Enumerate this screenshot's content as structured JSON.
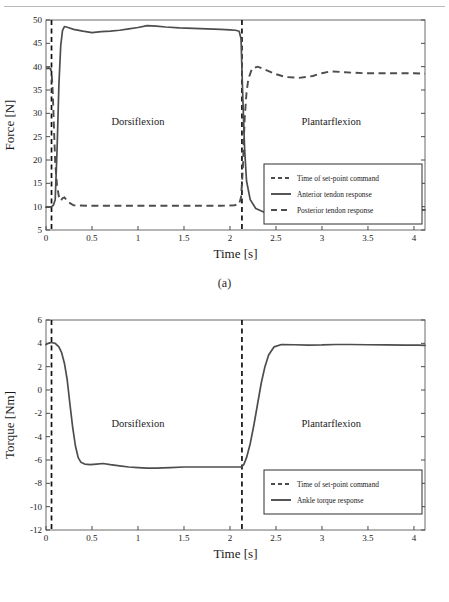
{
  "figure": {
    "caption_a": "(a)",
    "caption_b": "(b)"
  },
  "chart_data": [
    {
      "id": "force-plot",
      "type": "line",
      "title": "",
      "subplot_label": "(a)",
      "xlabel": "Time [s]",
      "ylabel": "Force [N]",
      "xlim": [
        0,
        4.12
      ],
      "ylim": [
        5,
        50
      ],
      "xticks": [
        0,
        0.5,
        1,
        1.5,
        2,
        2.5,
        3,
        3.5,
        4
      ],
      "xticklabels": [
        "0",
        "0.5",
        "1",
        "1.5",
        "2",
        "2.5",
        "3",
        "3.5",
        "4"
      ],
      "yticks": [
        5,
        10,
        15,
        20,
        25,
        30,
        35,
        40,
        45,
        50
      ],
      "yticklabels": [
        "5",
        "10",
        "15",
        "20",
        "25",
        "30",
        "35",
        "40",
        "45",
        "50"
      ],
      "grid": false,
      "annotations": [
        {
          "text": "Dorsiflexion",
          "x": 1.0,
          "y": 27.5
        },
        {
          "text": "Plantarflexion",
          "x": 3.1,
          "y": 27.5
        }
      ],
      "vlines": [
        0.06,
        2.13
      ],
      "legend_position": "center-right",
      "legend": [
        {
          "label": "Time of set-point command",
          "style": "dashed-thin"
        },
        {
          "label": "Anterior tendon response",
          "style": "solid"
        },
        {
          "label": "Posterior tendon response",
          "style": "dashed-thick"
        }
      ],
      "series": [
        {
          "name": "Anterior tendon response",
          "style": "solid",
          "x": [
            0.0,
            0.04,
            0.06,
            0.08,
            0.1,
            0.12,
            0.14,
            0.16,
            0.18,
            0.2,
            0.24,
            0.3,
            0.4,
            0.5,
            0.6,
            0.7,
            0.8,
            0.9,
            1.0,
            1.1,
            1.2,
            1.3,
            1.45,
            1.6,
            1.75,
            1.9,
            2.0,
            2.06,
            2.1,
            2.12,
            2.14,
            2.16,
            2.18,
            2.22,
            2.28,
            2.36,
            2.5,
            2.7,
            2.9,
            3.1,
            3.3,
            3.55,
            3.8,
            4.0,
            4.12
          ],
          "y": [
            9.9,
            9.9,
            10.0,
            10.3,
            11.5,
            22.0,
            36.0,
            44.5,
            47.8,
            48.6,
            48.4,
            48.0,
            47.6,
            47.3,
            47.5,
            47.6,
            47.8,
            48.1,
            48.4,
            48.8,
            48.7,
            48.5,
            48.3,
            48.2,
            48.1,
            48.0,
            47.9,
            47.8,
            47.6,
            46.0,
            33.0,
            22.0,
            15.5,
            11.5,
            9.6,
            8.9,
            8.8,
            8.8,
            8.9,
            8.9,
            8.9,
            9.0,
            9.1,
            9.2,
            9.3
          ]
        },
        {
          "name": "Posterior tendon response",
          "style": "dashed-thick",
          "x": [
            0.0,
            0.03,
            0.05,
            0.06,
            0.07,
            0.08,
            0.09,
            0.1,
            0.12,
            0.14,
            0.16,
            0.18,
            0.2,
            0.24,
            0.3,
            0.45,
            0.7,
            1.0,
            1.3,
            1.6,
            1.9,
            2.05,
            2.1,
            2.12,
            2.14,
            2.15,
            2.16,
            2.18,
            2.2,
            2.24,
            2.3,
            2.4,
            2.5,
            2.6,
            2.75,
            2.9,
            3.0,
            3.1,
            3.25,
            3.45,
            3.65,
            3.85,
            4.0,
            4.12
          ],
          "y": [
            39.6,
            39.7,
            39.5,
            38.8,
            36.0,
            31.0,
            25.0,
            19.5,
            14.5,
            12.2,
            11.3,
            11.8,
            12.0,
            11.0,
            10.3,
            10.2,
            10.2,
            10.2,
            10.2,
            10.2,
            10.2,
            10.3,
            10.6,
            12.0,
            18.0,
            24.0,
            29.0,
            34.5,
            37.4,
            39.6,
            40.0,
            39.2,
            38.4,
            37.8,
            37.6,
            38.0,
            38.6,
            39.0,
            38.8,
            38.6,
            38.6,
            38.6,
            38.6,
            38.5
          ]
        }
      ]
    },
    {
      "id": "torque-plot",
      "type": "line",
      "title": "",
      "subplot_label": "(b)",
      "xlabel": "Time [s]",
      "ylabel": "Torque [Nm]",
      "xlim": [
        0,
        4.12
      ],
      "ylim": [
        -12,
        6
      ],
      "xticks": [
        0,
        0.5,
        1,
        1.5,
        2,
        2.5,
        3,
        3.5,
        4
      ],
      "xticklabels": [
        "0",
        "0.5",
        "1",
        "1.5",
        "2",
        "2.5",
        "3",
        "3.5",
        "4"
      ],
      "yticks": [
        -12,
        -10,
        -8,
        -6,
        -4,
        -2,
        0,
        2,
        4,
        6
      ],
      "yticklabels": [
        "-12",
        "-10",
        "-8",
        "-6",
        "-4",
        "-2",
        "0",
        "2",
        "4",
        "6"
      ],
      "grid": false,
      "annotations": [
        {
          "text": "Dorsiflexion",
          "x": 1.0,
          "y": -3.2
        },
        {
          "text": "Plantarflexion",
          "x": 3.1,
          "y": -3.2
        }
      ],
      "vlines": [
        0.06,
        2.13
      ],
      "legend_position": "lower-right",
      "legend": [
        {
          "label": "Time of set-point command",
          "style": "dashed-thin"
        },
        {
          "label": "Ankle torque response",
          "style": "solid"
        }
      ],
      "series": [
        {
          "name": "Ankle torque response",
          "style": "solid",
          "x": [
            0.0,
            0.04,
            0.07,
            0.1,
            0.14,
            0.17,
            0.2,
            0.23,
            0.26,
            0.29,
            0.32,
            0.35,
            0.38,
            0.42,
            0.48,
            0.55,
            0.62,
            0.7,
            0.8,
            0.9,
            1.0,
            1.1,
            1.2,
            1.35,
            1.5,
            1.7,
            1.9,
            2.05,
            2.12,
            2.15,
            2.18,
            2.22,
            2.26,
            2.3,
            2.34,
            2.38,
            2.42,
            2.48,
            2.56,
            2.7,
            2.85,
            3.0,
            3.15,
            3.3,
            3.5,
            3.7,
            3.9,
            4.05,
            4.12
          ],
          "y": [
            3.9,
            4.05,
            4.05,
            4.0,
            3.7,
            3.2,
            2.3,
            0.9,
            -1.2,
            -3.2,
            -4.8,
            -5.8,
            -6.2,
            -6.35,
            -6.4,
            -6.35,
            -6.3,
            -6.4,
            -6.5,
            -6.6,
            -6.65,
            -6.7,
            -6.7,
            -6.65,
            -6.6,
            -6.6,
            -6.6,
            -6.6,
            -6.6,
            -6.4,
            -5.8,
            -4.6,
            -3.0,
            -1.2,
            0.6,
            2.0,
            3.0,
            3.7,
            3.9,
            3.88,
            3.85,
            3.86,
            3.9,
            3.9,
            3.88,
            3.86,
            3.85,
            3.84,
            3.83
          ]
        }
      ]
    }
  ]
}
